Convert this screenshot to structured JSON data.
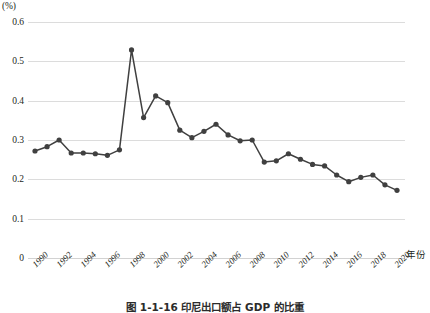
{
  "chart_data": {
    "type": "line",
    "title": "图 1-1-16  印尼出口额占 GDP 的比重",
    "xlabel": "年份",
    "ylabel": "(%)",
    "ylim": [
      0,
      0.6
    ],
    "yticks": [
      "0",
      "0.1",
      "0.2",
      "0.3",
      "0.4",
      "0.5",
      "0.6"
    ],
    "ytick_values": [
      0,
      0.1,
      0.2,
      0.3,
      0.4,
      0.5,
      0.6
    ],
    "xlim": [
      1990,
      2020
    ],
    "xticks": [
      "1990",
      "1992",
      "1994",
      "1996",
      "1998",
      "2000",
      "2002",
      "2004",
      "2006",
      "2008",
      "2010",
      "2012",
      "2014",
      "2016",
      "2018",
      "2020"
    ],
    "grid": "horizontal",
    "legend": "none",
    "marker": "filled-circle",
    "series_color": "#404040",
    "x": [
      1990,
      1991,
      1992,
      1993,
      1994,
      1995,
      1996,
      1997,
      1998,
      1999,
      2000,
      2001,
      2002,
      2003,
      2004,
      2005,
      2006,
      2007,
      2008,
      2009,
      2010,
      2011,
      2012,
      2013,
      2014,
      2015,
      2016,
      2017,
      2018,
      2019,
      2020
    ],
    "values": [
      0.272,
      0.283,
      0.3,
      0.267,
      0.267,
      0.265,
      0.261,
      0.275,
      0.529,
      0.357,
      0.412,
      0.395,
      0.325,
      0.306,
      0.322,
      0.34,
      0.313,
      0.298,
      0.3,
      0.244,
      0.247,
      0.265,
      0.251,
      0.238,
      0.234,
      0.211,
      0.194,
      0.205,
      0.211,
      0.186,
      0.172
    ],
    "annotations": []
  },
  "axis": {
    "y_unit": "(%)",
    "x_title": "年份"
  },
  "caption": {
    "text": "图 1-1-16  印尼出口额占 GDP 的比重"
  }
}
